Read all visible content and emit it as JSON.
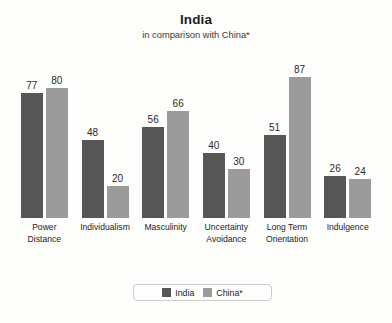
{
  "chart_data": {
    "type": "bar",
    "title": "India",
    "subtitle": "in comparison with China*",
    "xlabel": "",
    "ylabel": "",
    "ylim": [
      0,
      100
    ],
    "grid": false,
    "legend_position": "bottom-center",
    "categories": [
      "Power Distance",
      "Individualism",
      "Masculinity",
      "Uncertainty Avoidance",
      "Long Term Orientation",
      "Indulgence"
    ],
    "category_lines": [
      [
        "Power",
        "Distance"
      ],
      [
        "Individualism"
      ],
      [
        "Masculinity"
      ],
      [
        "Uncertainty",
        "Avoidance"
      ],
      [
        "Long Term",
        "Orientation"
      ],
      [
        "Indulgence"
      ]
    ],
    "series": [
      {
        "name": "India",
        "color": "#565656",
        "values": [
          77,
          48,
          56,
          40,
          51,
          26
        ]
      },
      {
        "name": "China*",
        "color": "#9b9b9b",
        "values": [
          80,
          20,
          66,
          30,
          87,
          24
        ]
      }
    ]
  },
  "legend": {
    "items": [
      {
        "label": "India"
      },
      {
        "label": "China*"
      }
    ]
  },
  "colors": {
    "series_a": "#565656",
    "series_b": "#9b9b9b",
    "background": "#fdfdfc",
    "text": "#1d1d1d",
    "legend_border": "#cdcdcd"
  }
}
